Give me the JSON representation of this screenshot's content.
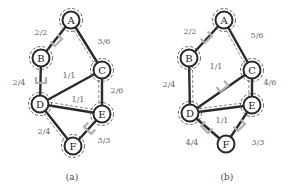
{
  "graphs": [
    {
      "caption": "(a)",
      "nodes": [
        {
          "id": "A",
          "x": 71,
          "y": 20,
          "ring": true
        },
        {
          "id": "B",
          "x": 41,
          "y": 58,
          "ring": true
        },
        {
          "id": "C",
          "x": 102,
          "y": 70,
          "ring": true
        },
        {
          "id": "D",
          "x": 40,
          "y": 104,
          "ring": true
        },
        {
          "id": "E",
          "x": 102,
          "y": 114,
          "ring": true
        },
        {
          "id": "F",
          "x": 73,
          "y": 146,
          "ring": true
        }
      ],
      "edges": [
        {
          "from": "A",
          "to": "B",
          "label": "2/2",
          "lx": 41,
          "ly": 32
        },
        {
          "from": "A",
          "to": "C",
          "label": "3/6",
          "lx": 104,
          "ly": 41
        },
        {
          "from": "B",
          "to": "D",
          "label": "2/4",
          "lx": 19,
          "ly": 82
        },
        {
          "from": "C",
          "to": "D",
          "label": "1/1",
          "lx": 69,
          "ly": 75
        },
        {
          "from": "C",
          "to": "E",
          "label": "2/6",
          "lx": 117,
          "ly": 90
        },
        {
          "from": "D",
          "to": "E",
          "label": "1/1",
          "lx": 78,
          "ly": 99
        },
        {
          "from": "D",
          "to": "F",
          "label": "2/4",
          "lx": 44,
          "ly": 131
        },
        {
          "from": "E",
          "to": "F",
          "label": "3/3",
          "lx": 104,
          "ly": 140
        }
      ],
      "flow_paths": [
        [
          "A",
          "C",
          "E",
          "D",
          "F"
        ]
      ],
      "saturated_markers": [
        {
          "x": 57,
          "y": 41,
          "angle": -45
        },
        {
          "x": 41,
          "y": 81,
          "angle": 0
        },
        {
          "x": 89,
          "y": 129,
          "angle": 45
        }
      ]
    },
    {
      "caption": "(b)",
      "nodes": [
        {
          "id": "A",
          "x": 224,
          "y": 20,
          "ring": true
        },
        {
          "id": "B",
          "x": 189,
          "y": 58,
          "ring": true
        },
        {
          "id": "C",
          "x": 252,
          "y": 70,
          "ring": true
        },
        {
          "id": "D",
          "x": 190,
          "y": 113,
          "ring": true
        },
        {
          "id": "E",
          "x": 252,
          "y": 105,
          "ring": true
        },
        {
          "id": "F",
          "x": 226,
          "y": 144,
          "ring": false
        }
      ],
      "edges": [
        {
          "from": "A",
          "to": "B",
          "label": "2/2",
          "lx": 190,
          "ly": 31
        },
        {
          "from": "A",
          "to": "C",
          "label": "5/6",
          "lx": 257,
          "ly": 35
        },
        {
          "from": "B",
          "to": "D",
          "label": "2/4",
          "lx": 169,
          "ly": 84
        },
        {
          "from": "C",
          "to": "D",
          "label": "1/1",
          "lx": 216,
          "ly": 66
        },
        {
          "from": "C",
          "to": "E",
          "label": "4/6",
          "lx": 270,
          "ly": 82
        },
        {
          "from": "D",
          "to": "E",
          "label": "1/1",
          "lx": 222,
          "ly": 120
        },
        {
          "from": "D",
          "to": "F",
          "label": "4/4",
          "lx": 192,
          "ly": 142
        },
        {
          "from": "E",
          "to": "F",
          "label": "3/3",
          "lx": 258,
          "ly": 142
        }
      ],
      "flow_paths": [
        [
          "A",
          "C",
          "E",
          "D",
          "B"
        ]
      ],
      "saturated_markers": [
        {
          "x": 207,
          "y": 38,
          "angle": -45
        },
        {
          "x": 223,
          "y": 87,
          "angle": -40
        },
        {
          "x": 206,
          "y": 128,
          "angle": 45
        },
        {
          "x": 240,
          "y": 126,
          "angle": -45
        }
      ]
    }
  ]
}
